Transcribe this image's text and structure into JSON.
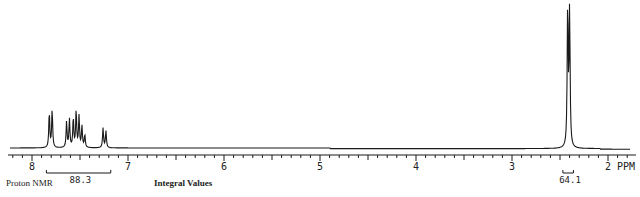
{
  "chart_data": {
    "type": "line",
    "title": "Proton NMR",
    "xlabel": "PPM",
    "ylabel": "",
    "x_reversed": true,
    "xlim": [
      8.25,
      1.7
    ],
    "x_ticks_major": [
      8,
      7,
      6,
      5,
      4,
      3,
      2
    ],
    "x_tick_labels": [
      "8",
      "7",
      "6",
      "5",
      "4",
      "3",
      "2 PPM"
    ],
    "minor_tick_step": 0.1,
    "grid": false,
    "legend": null,
    "series": [
      {
        "name": "spectrum",
        "peaks": [
          {
            "ppm": 7.82,
            "height": 0.25
          },
          {
            "ppm": 7.79,
            "height": 0.27
          },
          {
            "ppm": 7.64,
            "height": 0.18
          },
          {
            "ppm": 7.61,
            "height": 0.2
          },
          {
            "ppm": 7.57,
            "height": 0.21
          },
          {
            "ppm": 7.54,
            "height": 0.26
          },
          {
            "ppm": 7.51,
            "height": 0.22
          },
          {
            "ppm": 7.48,
            "height": 0.15
          },
          {
            "ppm": 7.45,
            "height": 0.09
          },
          {
            "ppm": 7.26,
            "height": 0.14
          },
          {
            "ppm": 7.23,
            "height": 0.12
          },
          {
            "ppm": 2.42,
            "height": 1.0
          },
          {
            "ppm": 2.4,
            "height": 0.96
          }
        ]
      }
    ],
    "annotations": {
      "label_left": "Proton NMR",
      "integral_title": "Integral Values",
      "integrals": [
        {
          "from_ppm": 7.85,
          "to_ppm": 7.18,
          "value": "88.3"
        },
        {
          "from_ppm": 2.47,
          "to_ppm": 2.36,
          "value": "64.1"
        }
      ]
    }
  },
  "labels": {
    "proton_nmr": "Proton NMR",
    "integral_values": "Integral Values",
    "integral_1": "88.3",
    "integral_2": "64.1",
    "axis_unit": "PPM"
  }
}
